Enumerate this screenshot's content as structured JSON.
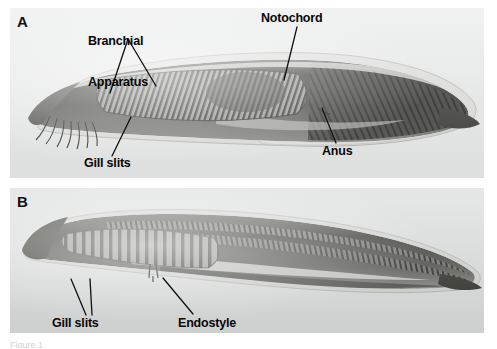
{
  "figure": {
    "background_color": "#ffffff",
    "caption_fragment": "Figure 1",
    "panels": [
      {
        "letter": "A",
        "name": "panel-a",
        "background_color": "#e9eaea",
        "subject": "amphioxus-lateral-view",
        "annotations": [
          {
            "name": "branchial-apparatus",
            "text": "Branchial\nApparatus"
          },
          {
            "name": "notochord",
            "text": "Notochord"
          },
          {
            "name": "anus",
            "text": "Anus"
          },
          {
            "name": "gill-slits",
            "text": "Gill slits"
          }
        ]
      },
      {
        "letter": "B",
        "name": "panel-b",
        "background_color": "#d9dbda",
        "subject": "amphioxus-larva-lateral-view",
        "annotations": [
          {
            "name": "gill-slits",
            "text": "Gill slits"
          },
          {
            "name": "endostyle",
            "text": "Endostyle"
          }
        ]
      }
    ]
  },
  "labels": {
    "panel_a_letter": "A",
    "panel_b_letter": "B",
    "branchial_apparatus_line1": "Branchial",
    "branchial_apparatus_line2": "Apparatus",
    "notochord": "Notochord",
    "anus": "Anus",
    "gill_slits_a": "Gill slits",
    "gill_slits_b": "Gill slits",
    "endostyle": "Endostyle"
  },
  "colors": {
    "label_text": "#080808",
    "leader_line": "#111111",
    "panel_a_bg": "#e9eaea",
    "panel_b_bg": "#d9dbda",
    "page_bg": "#ffffff"
  }
}
